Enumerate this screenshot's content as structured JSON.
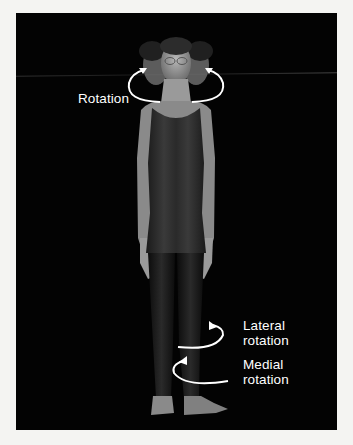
{
  "figure": {
    "background_color": "#030303",
    "page_color": "#f4f4f2",
    "annotation_color": "#ffffff",
    "labels": {
      "rotation": "Rotation",
      "lateral_line1": "Lateral",
      "lateral_line2": "rotation",
      "medial_line1": "Medial",
      "medial_line2": "rotation"
    },
    "arrows": [
      {
        "name": "head-rotation-arrow",
        "direction": "bidirectional-around-neck"
      },
      {
        "name": "lateral-rotation-arrow",
        "direction": "outward"
      },
      {
        "name": "medial-rotation-arrow",
        "direction": "inward"
      }
    ]
  }
}
